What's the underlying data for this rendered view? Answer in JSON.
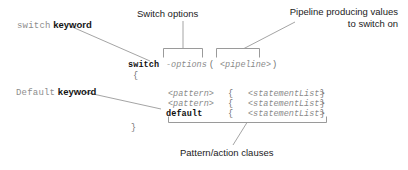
{
  "figure": {
    "background_color": "#ffffff",
    "line_color": "#9a9a9a",
    "code_gray": "#8a8a8a",
    "code_black": "#101010"
  },
  "annotations": [
    {
      "id": "switch-keyword",
      "code_part": "switch",
      "text_part": " keyword",
      "style": "code-plus-bold"
    },
    {
      "id": "switch-options",
      "text": "Switch options",
      "style": "plain"
    },
    {
      "id": "pipeline-note",
      "line1": "Pipeline producing values",
      "line2": "to switch on",
      "style": "plain"
    },
    {
      "id": "default-keyword",
      "code_part": "Default",
      "text_part": " keyword",
      "style": "code-plus-bold"
    },
    {
      "id": "pattern-action-clauses",
      "text": "Pattern/action clauses",
      "style": "plain"
    }
  ],
  "code": {
    "line_switch": {
      "keyword": "switch",
      "options": "-options",
      "paren_open": "(",
      "pipeline": "<pipeline>",
      "paren_close": ")"
    },
    "brace_open": "{",
    "clauses": [
      {
        "pattern": "<pattern>",
        "brace_open": "{",
        "body": "<statementList>",
        "brace_close": "}",
        "bold": false
      },
      {
        "pattern": "<pattern>",
        "brace_open": "{",
        "body": "<statementList>",
        "brace_close": "}",
        "bold": false
      },
      {
        "pattern": "default",
        "brace_open": "{",
        "body": "<statementList>",
        "brace_close": "}",
        "bold": true
      }
    ],
    "brace_close": "}"
  }
}
